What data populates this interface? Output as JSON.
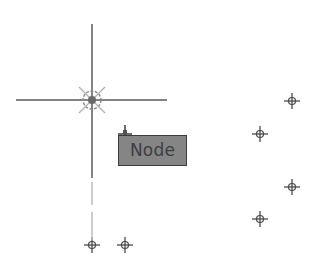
{
  "crosshair": {
    "center": [
      92,
      100
    ],
    "horizontal": [
      16,
      167
    ],
    "vertical_solid": [
      24,
      178
    ],
    "vertical_faint_segments": [
      [
        182,
        205
      ],
      [
        212,
        240
      ]
    ],
    "color": "#5a5a5a",
    "faint_color": "#bdbdbd"
  },
  "snap_marker": {
    "name": "node-snap-marker",
    "center": [
      92,
      100
    ],
    "radius": 9,
    "color": "#8a8a8a"
  },
  "tooltip": {
    "label": "Node",
    "box": [
      118,
      135,
      69,
      31
    ],
    "cursor_pin": [
      125,
      130
    ]
  },
  "nodes": [
    {
      "x": 292,
      "y": 101
    },
    {
      "x": 260,
      "y": 134
    },
    {
      "x": 292,
      "y": 187
    },
    {
      "x": 260,
      "y": 219
    },
    {
      "x": 92,
      "y": 245
    },
    {
      "x": 125,
      "y": 245
    }
  ],
  "colors": {
    "background": "#ffffff",
    "node_marker": "#4a4a4a",
    "tooltip_fill": "#858585",
    "tooltip_border": "#3c3c3c",
    "tooltip_text": "#3d3d3d"
  }
}
